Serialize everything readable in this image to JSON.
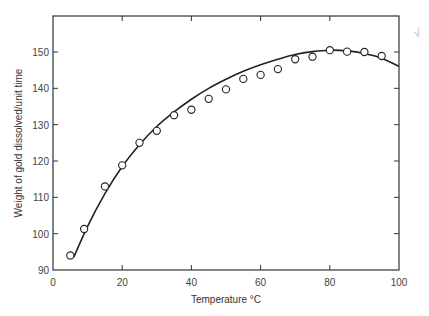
{
  "chart_data": {
    "type": "scatter",
    "title": "",
    "xlabel": "Temperature °C",
    "ylabel": "Weight of gold dissolved/unit time",
    "xlim": [
      0,
      100
    ],
    "ylim": [
      90,
      160
    ],
    "xticks": [
      0,
      20,
      40,
      60,
      80,
      100
    ],
    "yticks": [
      90,
      100,
      110,
      120,
      130,
      140,
      150
    ],
    "grid": false,
    "legend": null,
    "series": [
      {
        "name": "measured",
        "marker": "open-circle",
        "x": [
          5,
          9,
          15,
          20,
          25,
          30,
          35,
          40,
          45,
          50,
          55,
          60,
          65,
          70,
          75,
          80,
          85,
          90,
          95
        ],
        "y": [
          94,
          101.3,
          113,
          118.8,
          125,
          128.3,
          132.6,
          134.1,
          137.1,
          139.7,
          142.6,
          143.7,
          145.3,
          148,
          148.7,
          150.5,
          150.1,
          150,
          148.9
        ]
      },
      {
        "name": "fitted curve",
        "style": "line",
        "x": [
          6,
          10,
          15,
          20,
          25,
          30,
          35,
          40,
          45,
          50,
          55,
          60,
          65,
          70,
          75,
          80,
          85,
          90,
          95,
          100
        ],
        "y": [
          93.5,
          102,
          111,
          118.5,
          124.5,
          129.5,
          133.5,
          137,
          140,
          142.5,
          144.7,
          146.5,
          148,
          149.3,
          150.1,
          150.5,
          150.3,
          149.6,
          148.3,
          146
        ]
      }
    ],
    "annotations": [
      "√"
    ]
  },
  "labels": {
    "xlabel": "Temperature °C",
    "ylabel": "Weight of gold dissolved/unit time",
    "mark": "√"
  }
}
